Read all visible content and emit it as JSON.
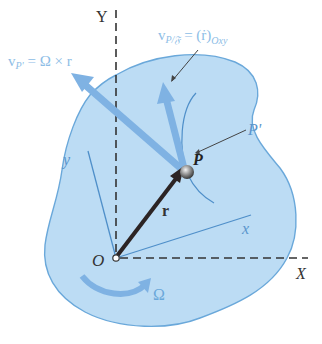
{
  "diagram": {
    "labels": {
      "Y_axis": "Y",
      "X_axis": "X",
      "origin": "O",
      "y_axis": "y",
      "x_axis": "x",
      "point": "P",
      "point_prime": "P'",
      "position_vector": "r",
      "omega": "Ω",
      "v_transport_main": "v",
      "v_transport_sub": "P'",
      "v_transport_rhs": " = Ω × r",
      "v_rel_main": "v",
      "v_rel_sub": "P/𝔉",
      "v_rel_rhs": " = (ṙ)",
      "v_rel_rhs_sub": "Oxy"
    },
    "colors": {
      "body_fill": "#bcdcf4",
      "body_stroke": "#6aa8da",
      "arrow_blue": "#7fb2e3",
      "label_blue": "#8dbde6",
      "axis_dark": "#333333",
      "r_vector": "#2c2424"
    }
  }
}
